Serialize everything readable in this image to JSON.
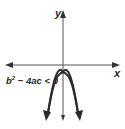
{
  "diagram": {
    "type": "coordinate-plane-parabola",
    "x_axis_label": "x",
    "y_axis_label": "y",
    "condition": {
      "base": "b",
      "exponent": "2",
      "rest": " − 4ac < 0"
    },
    "curve": {
      "shape": "parabola",
      "opens": "down",
      "vertex_position": "below x-axis on y-axis",
      "x_intercepts": 0
    },
    "colors": {
      "stroke": "#2a2a2a",
      "axis": "#555555",
      "background": "#ffffff"
    }
  }
}
